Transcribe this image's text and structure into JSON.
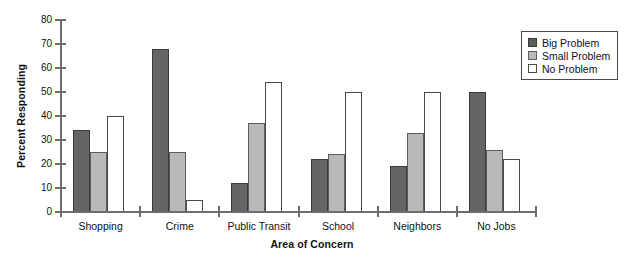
{
  "chart_data": {
    "type": "bar",
    "title": "",
    "xlabel": "Area of Concern",
    "ylabel": "Percent Responding",
    "ylim": [
      0,
      80
    ],
    "yticks": [
      0,
      10,
      20,
      30,
      40,
      50,
      60,
      70,
      80
    ],
    "grid": false,
    "legend_position": "top-right",
    "categories": [
      "Shopping",
      "Crime",
      "Public Transit",
      "School",
      "Neighbors",
      "No Jobs"
    ],
    "series": [
      {
        "name": "Big Problem",
        "values": [
          34,
          68,
          12,
          22,
          19,
          50
        ]
      },
      {
        "name": "Small Problem",
        "values": [
          25,
          25,
          37,
          24,
          33,
          26
        ]
      },
      {
        "name": "No Problem",
        "values": [
          40,
          5,
          54,
          50,
          50,
          22
        ]
      }
    ]
  },
  "axes": {
    "y_label": "Percent Responding",
    "x_label": "Area of Concern",
    "y_tick_labels": [
      "80",
      "70",
      "60",
      "50",
      "40",
      "30",
      "20",
      "10",
      "0"
    ],
    "x_tick_labels": [
      "Shopping",
      "Crime",
      "Public Transit",
      "School",
      "Neighbors",
      "No Jobs"
    ]
  },
  "legend": {
    "items": [
      {
        "label": "Big Problem",
        "color": "#5d5d5d"
      },
      {
        "label": "Small Problem",
        "color": "#b9b9b9"
      },
      {
        "label": "No Problem",
        "color": "#ffffff"
      }
    ]
  },
  "colors": {
    "big_problem": "#5d5d5d",
    "small_problem": "#b9b9b9",
    "no_problem": "#ffffff",
    "axis": "#6d6d6d",
    "text": "#111111",
    "background": "#ffffff"
  }
}
